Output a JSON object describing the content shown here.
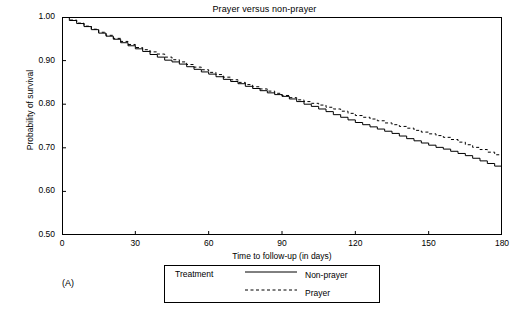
{
  "chart_data": {
    "type": "line",
    "title": "Prayer versus non-prayer",
    "xlabel": "Time to follow-up (in days)",
    "ylabel": "Probability of survival",
    "xlim": [
      0,
      180
    ],
    "ylim": [
      0.5,
      1.0
    ],
    "xticks": [
      0,
      30,
      60,
      90,
      120,
      150,
      180
    ],
    "xtick_labels": [
      "0",
      "30",
      "60",
      "90",
      "120",
      "150",
      "180"
    ],
    "yticks": [
      0.5,
      0.6,
      0.7,
      0.8,
      0.9,
      1.0
    ],
    "ytick_labels": [
      "0.50",
      "0.60",
      "0.70",
      "0.80",
      "0.90",
      "1.00"
    ],
    "grid": false,
    "legend_position": "below-center",
    "panel_label": "(A)",
    "legend": {
      "title": "Treatment",
      "entries": [
        {
          "label": "Non-prayer",
          "style": "solid"
        },
        {
          "label": "Prayer",
          "style": "dashed"
        }
      ]
    },
    "series": [
      {
        "name": "Non-prayer",
        "style": "solid",
        "x": [
          0,
          3,
          6,
          9,
          12,
          15,
          18,
          21,
          24,
          27,
          30,
          33,
          36,
          39,
          42,
          45,
          48,
          51,
          54,
          57,
          60,
          63,
          66,
          69,
          72,
          75,
          78,
          81,
          84,
          87,
          90,
          93,
          96,
          99,
          102,
          105,
          108,
          111,
          114,
          117,
          120,
          123,
          126,
          129,
          132,
          135,
          138,
          141,
          144,
          147,
          150,
          153,
          156,
          159,
          162,
          165,
          168,
          171,
          174,
          177,
          180
        ],
        "y": [
          1.0,
          0.992,
          0.985,
          0.978,
          0.971,
          0.963,
          0.956,
          0.949,
          0.941,
          0.934,
          0.927,
          0.921,
          0.914,
          0.908,
          0.901,
          0.897,
          0.892,
          0.886,
          0.88,
          0.874,
          0.869,
          0.863,
          0.857,
          0.852,
          0.847,
          0.841,
          0.836,
          0.831,
          0.826,
          0.822,
          0.818,
          0.812,
          0.806,
          0.8,
          0.795,
          0.789,
          0.783,
          0.776,
          0.77,
          0.764,
          0.758,
          0.753,
          0.748,
          0.743,
          0.738,
          0.733,
          0.727,
          0.721,
          0.716,
          0.711,
          0.706,
          0.701,
          0.697,
          0.692,
          0.687,
          0.682,
          0.676,
          0.67,
          0.664,
          0.658,
          0.655
        ]
      },
      {
        "name": "Prayer",
        "style": "dashed",
        "x": [
          0,
          3,
          6,
          9,
          12,
          15,
          18,
          21,
          24,
          27,
          30,
          33,
          36,
          39,
          42,
          45,
          48,
          51,
          54,
          57,
          60,
          63,
          66,
          69,
          72,
          75,
          78,
          81,
          84,
          87,
          90,
          93,
          96,
          99,
          102,
          105,
          108,
          111,
          114,
          117,
          120,
          123,
          126,
          129,
          132,
          135,
          138,
          141,
          144,
          147,
          150,
          153,
          156,
          159,
          162,
          165,
          168,
          171,
          174,
          177,
          180
        ],
        "y": [
          1.0,
          0.993,
          0.986,
          0.979,
          0.972,
          0.965,
          0.958,
          0.951,
          0.944,
          0.937,
          0.93,
          0.925,
          0.92,
          0.915,
          0.908,
          0.902,
          0.897,
          0.891,
          0.885,
          0.879,
          0.873,
          0.868,
          0.862,
          0.856,
          0.85,
          0.845,
          0.84,
          0.835,
          0.83,
          0.825,
          0.82,
          0.815,
          0.81,
          0.806,
          0.802,
          0.798,
          0.793,
          0.789,
          0.784,
          0.779,
          0.774,
          0.77,
          0.766,
          0.762,
          0.757,
          0.753,
          0.749,
          0.745,
          0.74,
          0.736,
          0.732,
          0.728,
          0.724,
          0.719,
          0.713,
          0.707,
          0.701,
          0.696,
          0.69,
          0.684,
          0.679
        ]
      }
    ]
  }
}
